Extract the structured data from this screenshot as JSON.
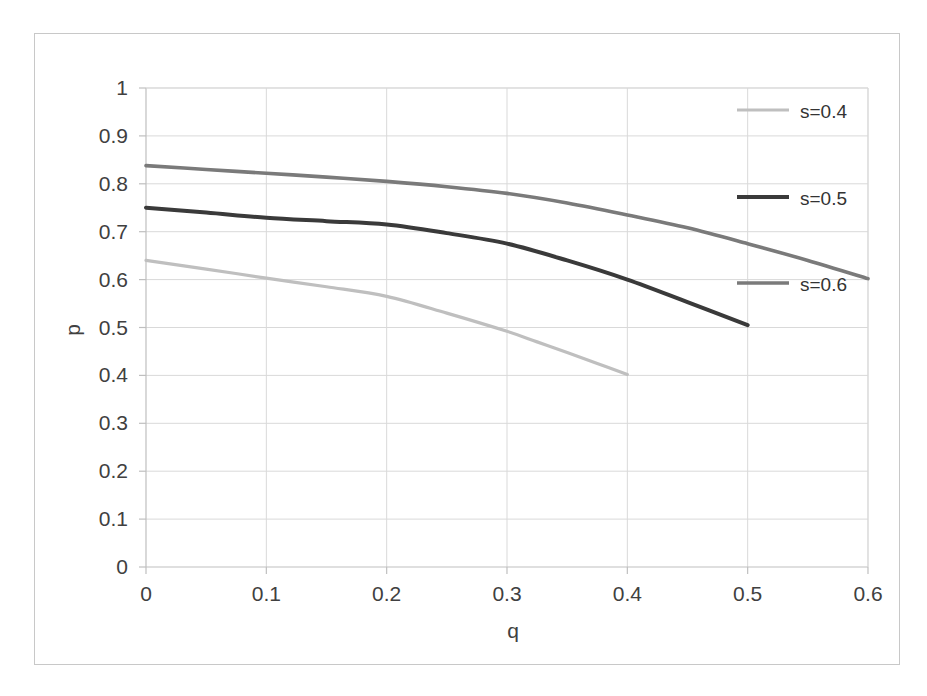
{
  "chart_data": {
    "type": "line",
    "title": "",
    "subtitle": "",
    "xlabel": "q",
    "ylabel": "p",
    "xlim": [
      0,
      0.6
    ],
    "ylim": [
      0,
      1
    ],
    "grid": true,
    "grid_axis": "both",
    "legend_position": "right-top-inside",
    "x_ticks": [
      "0",
      "0.1",
      "0.2",
      "0.3",
      "0.4",
      "0.5",
      "0.6"
    ],
    "x_tick_values": [
      0,
      0.1,
      0.2,
      0.3,
      0.4,
      0.5,
      0.6
    ],
    "y_ticks": [
      "0",
      "0.1",
      "0.2",
      "0.3",
      "0.4",
      "0.5",
      "0.6",
      "0.7",
      "0.8",
      "0.9",
      "1"
    ],
    "y_tick_values": [
      0,
      0.1,
      0.2,
      0.3,
      0.4,
      0.5,
      0.6,
      0.7,
      0.8,
      0.9,
      1
    ],
    "series": [
      {
        "name": "s=0.4",
        "color": "#bfbfbf",
        "width": 3.2,
        "x": [
          0,
          0.05,
          0.1,
          0.15,
          0.2,
          0.25,
          0.3,
          0.325,
          0.35,
          0.375,
          0.4
        ],
        "values": [
          0.64,
          0.622,
          0.603,
          0.585,
          0.565,
          0.53,
          0.492,
          0.47,
          0.448,
          0.425,
          0.402
        ]
      },
      {
        "name": "s=0.5",
        "color": "#3a3a3a",
        "width": 4.0,
        "x": [
          0,
          0.05,
          0.1,
          0.15,
          0.2,
          0.25,
          0.3,
          0.35,
          0.4,
          0.45,
          0.5
        ],
        "values": [
          0.75,
          0.74,
          0.729,
          0.722,
          0.715,
          0.697,
          0.675,
          0.64,
          0.6,
          0.553,
          0.505
        ]
      },
      {
        "name": "s=0.6",
        "color": "#7a7a7a",
        "width": 3.6,
        "x": [
          0,
          0.05,
          0.1,
          0.15,
          0.2,
          0.25,
          0.3,
          0.35,
          0.4,
          0.45,
          0.5,
          0.55,
          0.6
        ],
        "values": [
          0.838,
          0.83,
          0.822,
          0.814,
          0.805,
          0.794,
          0.78,
          0.76,
          0.735,
          0.708,
          0.675,
          0.64,
          0.602
        ]
      }
    ]
  },
  "legend": {
    "entries": [
      {
        "label": "s=0.4"
      },
      {
        "label": "s=0.5"
      },
      {
        "label": "s=0.6"
      }
    ]
  },
  "axes": {
    "x_title": "q",
    "y_title": "p"
  },
  "colors": {
    "series_light": "#bfbfbf",
    "series_dark": "#3a3a3a",
    "series_mid": "#7a7a7a",
    "grid": "#d9d9d9",
    "axis": "#bfbfbf",
    "frame": "#c8c8c8",
    "text": "#404040",
    "background": "#ffffff"
  }
}
